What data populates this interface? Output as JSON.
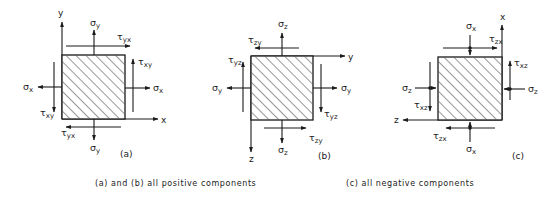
{
  "figure": {
    "panels": [
      {
        "id": "a",
        "tag": "(a)",
        "axes": {
          "horizontal": "x",
          "vertical": "y"
        },
        "labels": {
          "top_normal": {
            "sym": "σ",
            "sub": "y"
          },
          "top_shear": {
            "sym": "τ",
            "sub": "yx"
          },
          "right_shear": {
            "sym": "τ",
            "sub": "xy"
          },
          "right_normal": {
            "sym": "σ",
            "sub": "x"
          },
          "left_normal": {
            "sym": "σ",
            "sub": "x"
          },
          "left_shear": {
            "sym": "τ",
            "sub": "xy"
          },
          "bottom_shear": {
            "sym": "τ",
            "sub": "yx"
          },
          "bottom_normal": {
            "sym": "σ",
            "sub": "y"
          }
        }
      },
      {
        "id": "b",
        "tag": "(b)",
        "axes": {
          "horizontal": "y",
          "vertical": "z"
        },
        "labels": {
          "top_normal": {
            "sym": "σ",
            "sub": "z"
          },
          "top_shear": {
            "sym": "τ",
            "sub": "zy"
          },
          "left_shear": {
            "sym": "τ",
            "sub": "yz"
          },
          "left_normal": {
            "sym": "σ",
            "sub": "y"
          },
          "right_normal": {
            "sym": "σ",
            "sub": "y"
          },
          "right_shear": {
            "sym": "τ",
            "sub": "yz"
          },
          "bottom_shear": {
            "sym": "τ",
            "sub": "zy"
          },
          "bottom_normal": {
            "sym": "σ",
            "sub": "z"
          }
        }
      },
      {
        "id": "c",
        "tag": "(c)",
        "axes": {
          "horizontal": "z",
          "vertical": "x"
        },
        "labels": {
          "top_normal": {
            "sym": "σ",
            "sub": "x"
          },
          "top_shear": {
            "sym": "τ",
            "sub": "zx"
          },
          "right_shear": {
            "sym": "τ",
            "sub": "xz"
          },
          "right_normal": {
            "sym": "σ",
            "sub": "z"
          },
          "left_normal": {
            "sym": "σ",
            "sub": "z"
          },
          "left_shear": {
            "sym": "τ",
            "sub": "xz"
          },
          "bottom_shear": {
            "sym": "τ",
            "sub": "zx"
          },
          "bottom_normal": {
            "sym": "σ",
            "sub": "x"
          }
        }
      }
    ],
    "captions": {
      "positive": "(a) and (b) all positive components",
      "negative": "(c) all negative components"
    }
  }
}
